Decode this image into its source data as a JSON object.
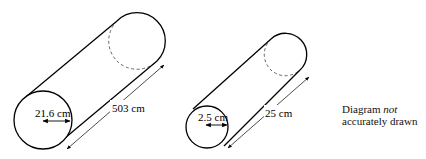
{
  "diagram": {
    "cylinders": [
      {
        "name": "large-cylinder",
        "radius_label": "21.6 cm",
        "length_label": "503 cm"
      },
      {
        "name": "small-cylinder",
        "radius_label": "2.5 cm",
        "length_label": "25 cm"
      }
    ],
    "note": {
      "line1_prefix": "Diagram ",
      "line1_emphasis": "not",
      "line2": "accurately drawn"
    }
  }
}
